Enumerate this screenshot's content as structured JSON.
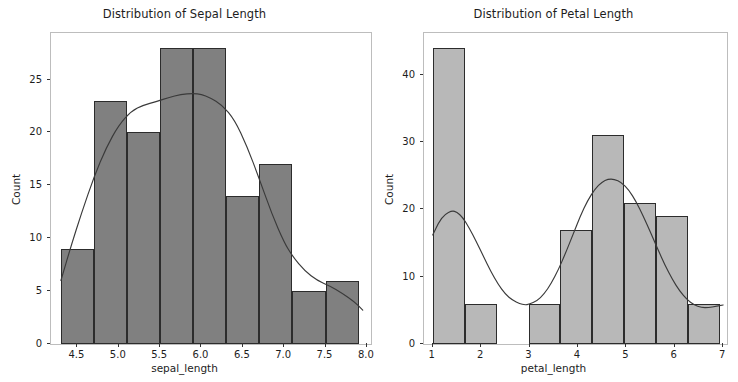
{
  "figure": {
    "background_color": "#ffffff",
    "panel_count": 2
  },
  "chart_data": [
    {
      "type": "bar",
      "subtype": "histogram-with-kde",
      "title": "Distribution of Sepal Length",
      "xlabel": "sepal_length",
      "ylabel": "Count",
      "xlim": [
        4.18,
        8.05
      ],
      "ylim": [
        0,
        29.4
      ],
      "xticks": [
        "4.5",
        "5.0",
        "5.5",
        "6.0",
        "6.5",
        "7.0",
        "7.5",
        "8.0"
      ],
      "xtick_values": [
        4.5,
        5.0,
        5.5,
        6.0,
        6.5,
        7.0,
        7.5,
        8.0
      ],
      "yticks": [
        "0",
        "5",
        "10",
        "15",
        "20",
        "25"
      ],
      "ytick_values": [
        0,
        5,
        10,
        15,
        20,
        25
      ],
      "grid": false,
      "legend": "none",
      "bar_fill_color": "#808080",
      "bar_edge_color": "#2c2c2c",
      "kde_line_color": "#3a3a3a",
      "bin_edges": [
        4.3,
        4.7,
        5.1,
        5.5,
        5.9,
        6.3,
        6.7,
        7.1,
        7.5,
        7.9
      ],
      "bin_centers": [
        4.5,
        4.9,
        5.3,
        5.7,
        6.1,
        6.5,
        6.9,
        7.3,
        7.7
      ],
      "values": [
        9,
        23,
        20,
        28,
        28,
        14,
        17,
        5,
        6
      ],
      "kde_points": [
        [
          4.3,
          6.0
        ],
        [
          4.42,
          9.2
        ],
        [
          4.55,
          12.4
        ],
        [
          4.7,
          15.8
        ],
        [
          4.85,
          18.6
        ],
        [
          5.0,
          20.7
        ],
        [
          5.15,
          22.0
        ],
        [
          5.3,
          22.6
        ],
        [
          5.45,
          22.9
        ],
        [
          5.6,
          23.3
        ],
        [
          5.75,
          23.6
        ],
        [
          5.9,
          23.7
        ],
        [
          6.0,
          23.6
        ],
        [
          6.1,
          23.3
        ],
        [
          6.25,
          22.6
        ],
        [
          6.4,
          21.2
        ],
        [
          6.55,
          18.7
        ],
        [
          6.7,
          15.6
        ],
        [
          6.85,
          12.3
        ],
        [
          7.0,
          9.6
        ],
        [
          7.1,
          8.3
        ],
        [
          7.25,
          6.9
        ],
        [
          7.4,
          6.0
        ],
        [
          7.55,
          5.5
        ],
        [
          7.7,
          4.8
        ],
        [
          7.85,
          4.0
        ],
        [
          7.95,
          3.2
        ]
      ]
    },
    {
      "type": "bar",
      "subtype": "histogram-with-kde",
      "title": "Distribution of Petal Length",
      "xlabel": "petal_length",
      "ylabel": "Count",
      "xlim": [
        0.82,
        7.08
      ],
      "ylim": [
        0,
        46.2
      ],
      "xticks": [
        "1",
        "2",
        "3",
        "4",
        "5",
        "6",
        "7"
      ],
      "xtick_values": [
        1,
        2,
        3,
        4,
        5,
        6,
        7
      ],
      "yticks": [
        "0",
        "10",
        "20",
        "30",
        "40"
      ],
      "ytick_values": [
        0,
        10,
        20,
        30,
        40
      ],
      "grid": false,
      "legend": "none",
      "bar_fill_color": "#b8b8b8",
      "bar_edge_color": "#2c2c2c",
      "kde_line_color": "#3a3a3a",
      "bin_edges": [
        1.0,
        1.66,
        2.32,
        2.98,
        3.64,
        4.3,
        4.96,
        5.62,
        6.28,
        6.94
      ],
      "bin_centers": [
        1.33,
        1.99,
        2.65,
        3.31,
        3.97,
        4.63,
        5.29,
        5.95,
        6.61
      ],
      "values": [
        44,
        6,
        0,
        6,
        17,
        31,
        21,
        19,
        6
      ],
      "kde_points": [
        [
          1.0,
          16.2
        ],
        [
          1.12,
          18.0
        ],
        [
          1.25,
          19.3
        ],
        [
          1.4,
          19.8
        ],
        [
          1.5,
          19.6
        ],
        [
          1.62,
          18.8
        ],
        [
          1.75,
          17.3
        ],
        [
          1.9,
          15.2
        ],
        [
          2.05,
          13.0
        ],
        [
          2.2,
          10.8
        ],
        [
          2.35,
          8.9
        ],
        [
          2.5,
          7.4
        ],
        [
          2.65,
          6.5
        ],
        [
          2.8,
          6.0
        ],
        [
          2.9,
          5.8
        ],
        [
          3.0,
          5.9
        ],
        [
          3.15,
          6.4
        ],
        [
          3.3,
          7.4
        ],
        [
          3.45,
          9.0
        ],
        [
          3.6,
          11.1
        ],
        [
          3.75,
          13.6
        ],
        [
          3.9,
          16.3
        ],
        [
          4.05,
          19.0
        ],
        [
          4.2,
          21.3
        ],
        [
          4.35,
          23.0
        ],
        [
          4.5,
          24.1
        ],
        [
          4.62,
          24.5
        ],
        [
          4.75,
          24.5
        ],
        [
          4.9,
          24.0
        ],
        [
          5.05,
          22.9
        ],
        [
          5.2,
          21.2
        ],
        [
          5.35,
          19.0
        ],
        [
          5.5,
          16.6
        ],
        [
          5.65,
          14.1
        ],
        [
          5.8,
          11.7
        ],
        [
          5.95,
          9.6
        ],
        [
          6.1,
          7.9
        ],
        [
          6.25,
          6.6
        ],
        [
          6.4,
          5.8
        ],
        [
          6.55,
          5.4
        ],
        [
          6.7,
          5.4
        ],
        [
          6.85,
          5.6
        ],
        [
          7.0,
          5.8
        ]
      ]
    }
  ]
}
